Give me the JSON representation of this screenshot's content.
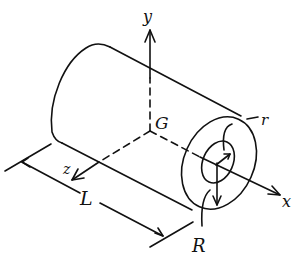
{
  "diagram": {
    "labels": {
      "y_axis": "y",
      "x_axis": "x",
      "z_axis": "z",
      "centroid": "G",
      "length": "L",
      "inner_radius": "r",
      "outer_radius": "R"
    },
    "colors": {
      "line": "#111111",
      "background": "#ffffff"
    }
  }
}
